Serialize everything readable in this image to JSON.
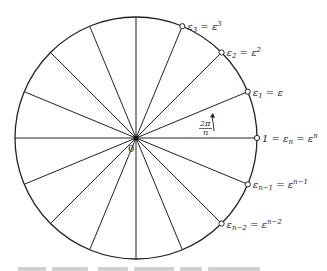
{
  "diagram": {
    "type": "unit-circle-roots-of-unity",
    "center_label": "0",
    "angle_label": {
      "numerator": "2π",
      "denominator": "n"
    },
    "num_rays": 16,
    "points": [
      {
        "id": "eps3",
        "angle_deg": 67.5,
        "base": "ε",
        "sub": "3",
        "rhs_base": "ε",
        "rhs_sup": "3"
      },
      {
        "id": "eps2",
        "angle_deg": 45,
        "base": "ε",
        "sub": "2",
        "rhs_base": "ε",
        "rhs_sup": "2"
      },
      {
        "id": "eps1",
        "angle_deg": 22.5,
        "base": "ε",
        "sub": "1",
        "rhs_base": "ε",
        "rhs_sup": ""
      },
      {
        "id": "one",
        "angle_deg": 0,
        "prefix": "1 = ",
        "base": "ε",
        "sub": "n",
        "rhs_base": "ε",
        "rhs_sup": "n"
      },
      {
        "id": "epsn1",
        "angle_deg": -22.5,
        "base": "ε",
        "sub": "n−1",
        "rhs_base": "ε",
        "rhs_sup": "n−1"
      },
      {
        "id": "epsn2",
        "angle_deg": -45,
        "base": "ε",
        "sub": "n−2",
        "rhs_base": "ε",
        "rhs_sup": "n−2"
      }
    ],
    "colors": {
      "stroke": "#222222",
      "background": "#ffffff"
    }
  }
}
